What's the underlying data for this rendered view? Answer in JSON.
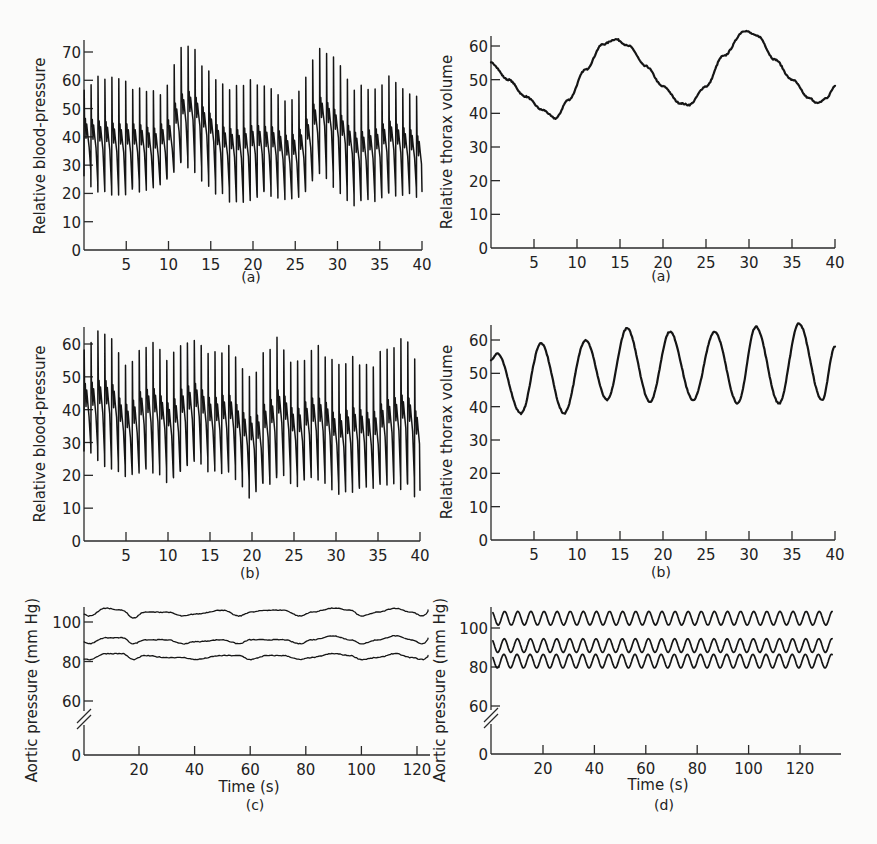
{
  "figure": {
    "panels_count": 6
  },
  "chart_data": [
    {
      "id": "bp_a",
      "type": "line",
      "panel_label": "(a)",
      "title": "",
      "xlabel": "",
      "ylabel": "Relative blood-pressure",
      "xlim": [
        0,
        40
      ],
      "ylim": [
        0,
        75
      ],
      "xticks": [
        5,
        10,
        15,
        20,
        25,
        30,
        35,
        40
      ],
      "yticks": [
        0,
        10,
        20,
        30,
        40,
        50,
        60,
        70
      ],
      "grid": false,
      "description": "Pulsatile blood-pressure trace (~1.2 beats/s) with respiratory modulation; slow envelope peaks near t=12 and t=28",
      "series": [
        {
          "name": "systolic_envelope",
          "x": [
            0,
            2,
            4,
            6,
            8,
            10,
            11,
            12,
            13,
            14,
            16,
            18,
            20,
            22,
            24,
            25,
            26,
            27,
            28,
            29,
            30,
            32,
            34,
            36,
            38,
            40
          ],
          "values": [
            58,
            61,
            60,
            57,
            55,
            57,
            68,
            73,
            70,
            66,
            58,
            58,
            59,
            57,
            53,
            54,
            59,
            66,
            71,
            69,
            65,
            57,
            58,
            60,
            57,
            52
          ]
        },
        {
          "name": "diastolic_envelope",
          "x": [
            0,
            2,
            4,
            6,
            8,
            10,
            11,
            12,
            13,
            14,
            16,
            18,
            20,
            22,
            24,
            25,
            26,
            27,
            28,
            29,
            30,
            32,
            34,
            36,
            38,
            40
          ],
          "values": [
            25,
            20,
            19,
            22,
            21,
            25,
            30,
            30,
            28,
            25,
            19,
            17,
            19,
            20,
            18,
            18,
            22,
            27,
            27,
            24,
            21,
            16,
            17,
            21,
            19,
            17
          ]
        }
      ]
    },
    {
      "id": "thorax_a",
      "type": "line",
      "panel_label": "(a)",
      "title": "",
      "xlabel": "",
      "ylabel": "Relative thorax volume",
      "xlim": [
        0,
        40
      ],
      "ylim": [
        0,
        63
      ],
      "xticks": [
        5,
        10,
        15,
        20,
        25,
        30,
        35,
        40
      ],
      "yticks": [
        0,
        10,
        20,
        30,
        40,
        50,
        60
      ],
      "grid": false,
      "series": [
        {
          "name": "thorax_volume",
          "x": [
            0,
            2,
            4,
            6,
            7.5,
            9,
            11,
            13,
            14.5,
            16,
            18,
            20,
            22,
            23,
            25,
            27,
            29.5,
            31,
            33,
            35,
            37,
            38,
            39,
            40
          ],
          "values": [
            55,
            50,
            45,
            41,
            38.5,
            44,
            53,
            60.5,
            62,
            60,
            54,
            48,
            43,
            42.5,
            48,
            57,
            64.5,
            63,
            56,
            50,
            44.5,
            43,
            44.5,
            48
          ]
        }
      ]
    },
    {
      "id": "bp_b",
      "type": "line",
      "panel_label": "(b)",
      "title": "",
      "xlabel": "",
      "ylabel": "Relative blood-pressure",
      "xlim": [
        0,
        40
      ],
      "ylim": [
        0,
        65
      ],
      "xticks": [
        5,
        10,
        15,
        20,
        25,
        30,
        35,
        40
      ],
      "yticks": [
        0,
        10,
        20,
        30,
        40,
        50,
        60
      ],
      "grid": false,
      "description": "Pulsatile blood-pressure trace with faster respiratory modulation (~5 s period)",
      "series": [
        {
          "name": "systolic_envelope",
          "x": [
            0,
            2,
            3,
            4,
            5,
            7,
            8,
            10,
            12,
            13,
            15,
            17,
            19,
            20,
            22,
            23,
            25,
            27,
            28,
            30,
            32,
            34,
            36,
            38,
            40
          ],
          "values": [
            58,
            64,
            64,
            57,
            53,
            60,
            61,
            55,
            61,
            62,
            56,
            59,
            53,
            51,
            58,
            62,
            53,
            58,
            59,
            53,
            56,
            53,
            58,
            62,
            52
          ]
        },
        {
          "name": "diastolic_envelope",
          "x": [
            0,
            2,
            3,
            4,
            5,
            7,
            8,
            10,
            12,
            13,
            15,
            17,
            19,
            20,
            22,
            23,
            25,
            27,
            28,
            30,
            32,
            34,
            36,
            38,
            40
          ],
          "values": [
            28,
            24,
            23,
            20,
            20,
            22,
            22,
            19,
            23,
            24,
            21,
            20,
            15,
            14,
            18,
            20,
            17,
            19,
            18,
            14,
            15,
            15,
            18,
            17,
            14
          ]
        }
      ]
    },
    {
      "id": "thorax_b",
      "type": "line",
      "panel_label": "(b)",
      "title": "",
      "xlabel": "",
      "ylabel": "Relative thorax volume",
      "xlim": [
        0,
        40
      ],
      "ylim": [
        0,
        65
      ],
      "xticks": [
        5,
        10,
        15,
        20,
        25,
        30,
        35,
        40
      ],
      "yticks": [
        0,
        10,
        20,
        30,
        40,
        50,
        60
      ],
      "grid": false,
      "series": [
        {
          "name": "thorax_volume",
          "x": [
            0,
            0.7,
            3.5,
            5.8,
            8.5,
            11,
            13.5,
            15.8,
            18.5,
            20.8,
            23.5,
            26,
            28.7,
            30.8,
            33.5,
            35.8,
            38.5,
            40
          ],
          "values": [
            54,
            56,
            38,
            59,
            38,
            60,
            42,
            63.5,
            41.5,
            62.5,
            42,
            62.5,
            41,
            64,
            41,
            65,
            42,
            58
          ]
        }
      ]
    },
    {
      "id": "aortic_c",
      "type": "line",
      "panel_label": "(c)",
      "title": "",
      "xlabel": "Time (s)",
      "ylabel": "Aortic pressure (mm Hg)",
      "xlim": [
        0,
        125
      ],
      "ylim": [
        0,
        110
      ],
      "axis_break": true,
      "xticks": [
        20,
        40,
        60,
        80,
        100,
        120
      ],
      "yticks": [
        0,
        60,
        80,
        100
      ],
      "grid": false,
      "description": "Three nearly-flat traces (systolic, mean, diastolic) with slow irregular fluctuations",
      "series": [
        {
          "name": "systolic",
          "x": [
            0,
            2,
            8,
            14,
            18,
            22,
            30,
            36,
            40,
            50,
            56,
            60,
            66,
            72,
            78,
            82,
            90,
            96,
            100,
            106,
            112,
            118,
            122,
            125
          ],
          "values": [
            104,
            103,
            107,
            106,
            102,
            105,
            105,
            103,
            104,
            106,
            103,
            105,
            106,
            106,
            103,
            105,
            107,
            106,
            103,
            105,
            107,
            105,
            103,
            106
          ]
        },
        {
          "name": "mean",
          "x": [
            0,
            2,
            8,
            14,
            18,
            22,
            30,
            36,
            40,
            50,
            56,
            60,
            66,
            72,
            78,
            82,
            90,
            96,
            100,
            106,
            112,
            118,
            122,
            125
          ],
          "values": [
            90,
            89,
            92,
            92,
            89,
            91,
            91,
            89,
            90,
            91,
            89,
            91,
            91,
            91,
            89,
            91,
            93,
            91,
            89,
            91,
            93,
            91,
            89,
            92
          ]
        },
        {
          "name": "diastolic",
          "x": [
            0,
            2,
            8,
            14,
            18,
            22,
            30,
            36,
            40,
            50,
            56,
            60,
            66,
            72,
            78,
            82,
            90,
            96,
            100,
            106,
            112,
            118,
            122,
            125
          ],
          "values": [
            81,
            81,
            84,
            84,
            81,
            83,
            82,
            82,
            81,
            83,
            83,
            81,
            83,
            83,
            81,
            82,
            84,
            83,
            81,
            82,
            84,
            82,
            81,
            83
          ]
        }
      ]
    },
    {
      "id": "aortic_d",
      "type": "line",
      "panel_label": "(d)",
      "title": "",
      "xlabel": "Time (s)",
      "ylabel": "Aortic pressure (mm Hg)",
      "xlim": [
        0,
        135
      ],
      "ylim": [
        0,
        110
      ],
      "axis_break": true,
      "xticks": [
        20,
        40,
        60,
        80,
        100,
        120
      ],
      "yticks": [
        0,
        60,
        80,
        100
      ],
      "grid": false,
      "description": "Three regular sinusoidal traces with ~5 s period (about 26 cycles over 133 s)",
      "series": [
        {
          "name": "systolic",
          "center": 105,
          "amplitude": 3.5,
          "period_s": 5.1
        },
        {
          "name": "mean",
          "center": 91,
          "amplitude": 3.5,
          "period_s": 5.1
        },
        {
          "name": "diastolic",
          "center": 83,
          "amplitude": 3.5,
          "period_s": 5.1
        }
      ]
    }
  ]
}
